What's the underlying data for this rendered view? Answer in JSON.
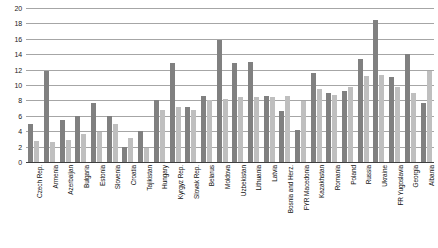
{
  "chart_data": {
    "type": "bar",
    "title": "",
    "subtitle": "",
    "xlabel": "",
    "ylabel": "",
    "ylim": [
      0,
      20
    ],
    "ytick_step": 2,
    "yticks": [
      0,
      2,
      4,
      6,
      8,
      10,
      12,
      14,
      16,
      18,
      20
    ],
    "ytick_labels": [
      "0",
      "2",
      "4",
      "6",
      "8",
      "10",
      "12",
      "14",
      "16",
      "18",
      "20"
    ],
    "grid": true,
    "grid_axis": "y",
    "legend": false,
    "legend_position": "none",
    "orientation": "vertical",
    "categories": [
      "Czech Rep.",
      "Armenia",
      "Azerbaijan",
      "Bulgaria",
      "Estonia",
      "Slovenia",
      "Croatia",
      "Tajikistan",
      "Hungary",
      "Kyrgyz Rep.",
      "Slovak Rep.",
      "Belarus",
      "Moldova",
      "Uzbekistan",
      "Lithuania",
      "Latvia",
      "Bosnia and Herz.",
      "FYR Macedonia",
      "Kazakhstan",
      "Romania",
      "Poland",
      "Russia",
      "Ukraine",
      "FR Yugoslavia",
      "Georgia",
      "Albania"
    ],
    "series": [
      {
        "name": "series-1",
        "color": "#808080",
        "values": [
          4.9,
          11.8,
          5.4,
          6.0,
          7.6,
          6.0,
          1.9,
          4.0,
          8.0,
          12.9,
          7.1,
          8.6,
          15.9,
          12.8,
          13.0,
          8.6,
          6.6,
          4.2,
          11.5,
          9.0,
          9.2,
          13.4,
          18.4,
          11.0,
          14.0,
          7.7
        ]
      },
      {
        "name": "series-2",
        "color": "#bfbfbf",
        "values": [
          2.7,
          2.6,
          2.9,
          3.7,
          3.9,
          5.0,
          3.1,
          1.8,
          6.7,
          7.2,
          6.7,
          8.1,
          8.2,
          8.5,
          8.5,
          8.4,
          8.6,
          7.9,
          9.5,
          8.7,
          9.8,
          11.2,
          11.3,
          9.8,
          9.0,
          11.8
        ]
      }
    ]
  },
  "axis": {
    "y_axis_name": "value-axis",
    "x_axis_name": "category-axis"
  }
}
